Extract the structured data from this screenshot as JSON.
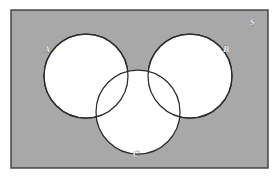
{
  "figure": {
    "type": "venn-diagram",
    "caption": "",
    "universe_label": "S",
    "background_color": "#ffffff",
    "universe_fill": "#a8a8a8",
    "universe_border_color": "#3b3b3b",
    "circle_fill": "#ffffff",
    "circle_stroke": "#2b2b2b"
  },
  "universe": {
    "label": "S",
    "name": "universal-set",
    "rect": {
      "x": 11,
      "y": 10,
      "width": 257,
      "height": 158
    },
    "label_position": {
      "x": 252,
      "y": 25
    }
  },
  "sets": [
    {
      "id": "A",
      "label": "A",
      "name": "set-a",
      "center": {
        "cx": 86,
        "cy": 76
      },
      "radius": 42,
      "label_position": {
        "x": 47,
        "y": 52
      }
    },
    {
      "id": "B",
      "label": "B",
      "name": "set-b",
      "center": {
        "cx": 190,
        "cy": 76
      },
      "radius": 42,
      "label_position": {
        "x": 226,
        "y": 52
      }
    },
    {
      "id": "C",
      "label": "C",
      "name": "set-c",
      "center": {
        "cx": 138,
        "cy": 112
      },
      "radius": 42,
      "label_position": {
        "x": 136,
        "y": 157
      }
    }
  ],
  "relations": {
    "a_b": "tangent",
    "a_c": "overlapping",
    "b_c": "overlapping",
    "a_b_c": "empty",
    "tangent_point": {
      "x": 138,
      "y": 72
    }
  },
  "regions": [
    {
      "name": "region-a-only",
      "fill": "#ffffff"
    },
    {
      "name": "region-b-only",
      "fill": "#ffffff"
    },
    {
      "name": "region-c-only",
      "fill": "#ffffff"
    },
    {
      "name": "region-a-intersect-c",
      "fill": "#ffffff"
    },
    {
      "name": "region-b-intersect-c",
      "fill": "#ffffff"
    },
    {
      "name": "region-outside-sets",
      "fill": "#a8a8a8"
    }
  ]
}
